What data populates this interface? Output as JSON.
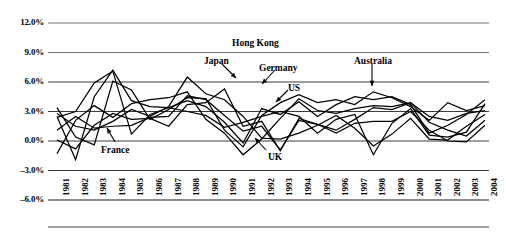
{
  "chart_data": {
    "type": "line",
    "title": "",
    "xlabel": "",
    "ylabel": "",
    "ylim": [
      -6.0,
      12.0
    ],
    "ytick_values": [
      12.0,
      9.0,
      6.0,
      3.0,
      0.0,
      -3.0,
      -6.0
    ],
    "ytick_labels": [
      "12.0%",
      "9.0%",
      "6.0%",
      "3.0%",
      "0.0%",
      "–3.0%",
      "–6.0%"
    ],
    "grid": true,
    "legend_position": "inline-annotations",
    "x": [
      1981,
      1982,
      1983,
      1984,
      1985,
      1986,
      1987,
      1988,
      1989,
      1990,
      1991,
      1992,
      1993,
      1994,
      1995,
      1996,
      1997,
      1998,
      1999,
      2000,
      2001,
      2002,
      2003,
      2004
    ],
    "xtick_labels": [
      "1981",
      "1982",
      "1983",
      "1984",
      "1985",
      "1986",
      "1987",
      "1988",
      "1989",
      "1990",
      "1991",
      "1992",
      "1993",
      "1994",
      "1995",
      "1996",
      "1997",
      "1998",
      "1999",
      "2000",
      "2001",
      "2002",
      "2003",
      "2004"
    ],
    "series": [
      {
        "name": "Hong Kong",
        "values": [
          2.4,
          3.0,
          5.9,
          7.1,
          0.7,
          2.7,
          3.4,
          3.0,
          2.6,
          1.4,
          1.9,
          2.5,
          3.0,
          2.5,
          0.8,
          2.2,
          2.7,
          -1.4,
          1.8,
          3.3,
          0.6,
          0.4,
          0.9,
          3.8
        ]
      },
      {
        "name": "Japan",
        "values": [
          2.8,
          1.5,
          1.1,
          2.0,
          3.2,
          2.5,
          3.5,
          6.5,
          4.8,
          4.2,
          2.5,
          0.3,
          0.2,
          0.8,
          1.6,
          2.6,
          1.3,
          -0.5,
          0.7,
          2.3,
          0.2,
          0.1,
          1.5,
          2.7
        ]
      },
      {
        "name": "Germany",
        "values": [
          0.1,
          -0.8,
          1.6,
          2.8,
          2.2,
          2.3,
          1.5,
          3.7,
          3.9,
          5.3,
          1.5,
          2.0,
          -1.0,
          2.3,
          1.7,
          0.8,
          1.8,
          2.0,
          2.0,
          3.0,
          1.1,
          0.0,
          -0.1,
          1.6
        ]
      },
      {
        "name": "US",
        "values": [
          2.5,
          -1.9,
          4.5,
          7.2,
          4.1,
          3.5,
          3.4,
          4.1,
          3.5,
          1.9,
          -0.2,
          3.3,
          2.7,
          4.0,
          2.5,
          3.7,
          4.5,
          4.2,
          4.5,
          3.7,
          0.8,
          1.6,
          2.7,
          4.2
        ]
      },
      {
        "name": "UK",
        "values": [
          -1.3,
          2.1,
          3.6,
          2.4,
          3.8,
          4.2,
          4.4,
          5.0,
          2.2,
          0.8,
          -1.4,
          0.2,
          2.3,
          4.3,
          3.1,
          2.8,
          3.3,
          3.6,
          3.5,
          3.9,
          2.5,
          2.1,
          2.8,
          3.1
        ]
      },
      {
        "name": "France",
        "values": [
          1.1,
          2.5,
          1.3,
          1.5,
          1.6,
          2.4,
          2.5,
          4.6,
          4.2,
          2.6,
          1.0,
          1.5,
          -0.9,
          2.1,
          1.7,
          1.1,
          2.2,
          3.4,
          3.2,
          3.9,
          1.9,
          1.1,
          0.5,
          2.1
        ]
      },
      {
        "name": "Australia",
        "values": [
          3.4,
          0.4,
          -0.4,
          6.1,
          5.2,
          2.2,
          3.2,
          4.4,
          4.3,
          1.1,
          -0.6,
          2.6,
          3.9,
          4.7,
          3.9,
          4.2,
          3.7,
          5.0,
          4.4,
          3.5,
          2.1,
          3.9,
          3.1,
          3.6
        ]
      }
    ],
    "annotations": [
      {
        "text": "Hong Kong",
        "label_x": 232,
        "label_y": 38,
        "arrow": null
      },
      {
        "text": "Japan",
        "label_x": 204,
        "label_y": 56,
        "arrow": {
          "x1": 222,
          "y1": 64,
          "x2": 236,
          "y2": 78
        }
      },
      {
        "text": "Germany",
        "label_x": 259,
        "label_y": 63,
        "arrow": {
          "x1": 275,
          "y1": 70,
          "x2": 262,
          "y2": 84
        }
      },
      {
        "text": "US",
        "label_x": 288,
        "label_y": 83,
        "arrow": {
          "x1": 288,
          "y1": 90,
          "x2": 276,
          "y2": 102
        }
      },
      {
        "text": "Australia",
        "label_x": 354,
        "label_y": 56,
        "arrow": {
          "x1": 372,
          "y1": 64,
          "x2": 372,
          "y2": 86
        }
      },
      {
        "text": "France",
        "label_x": 101,
        "label_y": 145,
        "arrow": {
          "x1": 115,
          "y1": 142,
          "x2": 107,
          "y2": 128
        }
      },
      {
        "text": "UK",
        "label_x": 268,
        "label_y": 152,
        "arrow": {
          "x1": 266,
          "y1": 150,
          "x2": 255,
          "y2": 138
        }
      }
    ],
    "colors": {
      "line": "#000000",
      "grid": "#000000",
      "text": "#000000",
      "background": "#ffffff"
    }
  }
}
